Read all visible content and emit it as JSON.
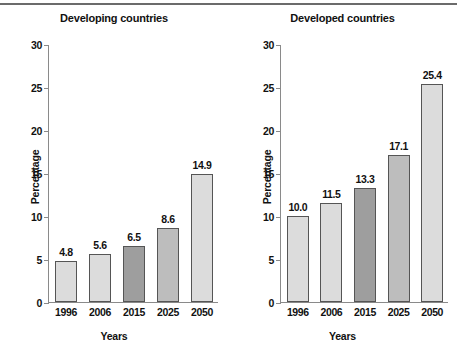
{
  "charts": [
    {
      "id": "developing",
      "title": "Developing countries",
      "chart_data": {
        "type": "bar",
        "title": "Developing countries",
        "xlabel": "Years",
        "ylabel": "Percentage",
        "categories": [
          "1996",
          "2006",
          "2015",
          "2025",
          "2050"
        ],
        "values": [
          4.8,
          5.6,
          6.5,
          8.6,
          14.9
        ],
        "labels": [
          "4.8",
          "5.6",
          "6.5",
          "8.6",
          "14.9"
        ],
        "bar_colors": [
          "#dcdcdc",
          "#dcdcdc",
          "#9e9e9e",
          "#bdbdbd",
          "#dcdcdc"
        ],
        "ylim": [
          0,
          30
        ],
        "yticks": [
          0,
          5,
          10,
          15,
          20,
          25,
          30
        ],
        "ytick_labels": [
          "0",
          "5",
          "10",
          "15",
          "20",
          "25",
          "30"
        ],
        "grid": false,
        "legend": "none"
      }
    },
    {
      "id": "developed",
      "title": "Developed countries",
      "chart_data": {
        "type": "bar",
        "title": "Developed countries",
        "xlabel": "Years",
        "ylabel": "Percentage",
        "categories": [
          "1996",
          "2006",
          "2015",
          "2025",
          "2050"
        ],
        "values": [
          10.0,
          11.5,
          13.3,
          17.1,
          25.4
        ],
        "labels": [
          "10.0",
          "11.5",
          "13.3",
          "17.1",
          "25.4"
        ],
        "bar_colors": [
          "#dcdcdc",
          "#dcdcdc",
          "#9e9e9e",
          "#bdbdbd",
          "#dcdcdc"
        ],
        "ylim": [
          0,
          30
        ],
        "yticks": [
          0,
          5,
          10,
          15,
          20,
          25,
          30
        ],
        "ytick_labels": [
          "0",
          "5",
          "10",
          "15",
          "20",
          "25",
          "30"
        ],
        "grid": false,
        "legend": "none"
      }
    }
  ],
  "style": {
    "axis_color": "#8a8a8a",
    "bar_outline": "#555555",
    "text_color": "#111111",
    "rule_color": "#6b6b6b"
  }
}
